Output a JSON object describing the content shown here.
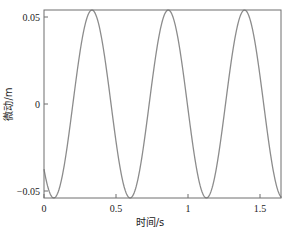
{
  "chart_data": {
    "type": "line",
    "title": "",
    "xlabel": "时间/s",
    "ylabel": "微动/m",
    "xlim": [
      0,
      1.65
    ],
    "ylim": [
      -0.054,
      0.054
    ],
    "grid": false,
    "legend": null,
    "x_ticks": [
      0,
      0.5,
      1,
      1.5
    ],
    "x_tick_labels": [
      "0",
      "0.5",
      "1",
      "1.5"
    ],
    "y_ticks": [
      -0.05,
      0,
      0.05
    ],
    "y_tick_labels": [
      "−0.05",
      "0",
      "0.05"
    ],
    "series": [
      {
        "name": "micro-motion",
        "color": "#8c8c8c",
        "function": "y = -0.054*cos(2*pi*(t-0.068)/0.53)",
        "amplitude": 0.054,
        "period": 0.53,
        "phase_trough_t": 0.068,
        "key_points": [
          {
            "t": 0.0,
            "y": -0.045
          },
          {
            "t": 0.068,
            "y": -0.054
          },
          {
            "t": 0.333,
            "y": 0.054
          },
          {
            "t": 0.598,
            "y": -0.054
          },
          {
            "t": 0.863,
            "y": 0.054
          },
          {
            "t": 1.128,
            "y": -0.054
          },
          {
            "t": 1.393,
            "y": 0.054
          },
          {
            "t": 1.65,
            "y": -0.053
          }
        ]
      }
    ]
  }
}
